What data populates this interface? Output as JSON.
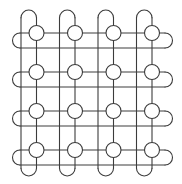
{
  "diagram": {
    "type": "knot-grid",
    "rows": 4,
    "cols": 4,
    "colors": {
      "background": "#ffffff",
      "line": "#3c3c3c",
      "node_fill": "#ffffff"
    },
    "geometry": {
      "col_left_line_x": [
        21,
        59.5,
        98,
        136.5
      ],
      "col_center_x": [
        36.5,
        75,
        113.5,
        152
      ],
      "row_center_y": [
        33,
        72,
        111,
        150
      ],
      "row_bottom_line_y": [
        48,
        87,
        126,
        165
      ],
      "node_radius": 7.5,
      "loop_radius_vertical": 7.75,
      "loop_radius_horizontal": 7.5,
      "h_line_x_start": 20,
      "h_line_x_end": 165,
      "v_line_y_start": 17.75,
      "v_line_y_end": 168.25
    }
  }
}
